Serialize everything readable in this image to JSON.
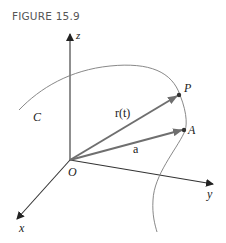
{
  "figure": {
    "title": "FIGURE 15.9"
  },
  "labels": {
    "z_axis": "z",
    "y_axis": "y",
    "x_axis": "x",
    "origin": "O",
    "curve": "C",
    "point_p": "P",
    "point_a": "A",
    "vector_r": "r(t)",
    "vector_a": "a"
  },
  "colors": {
    "vector": "#6f6f6f",
    "axis": "#333333",
    "curve": "#7a7a7a"
  }
}
